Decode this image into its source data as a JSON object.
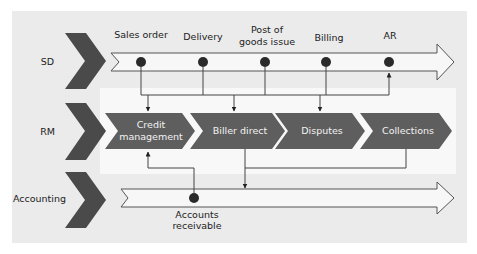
{
  "lanes": [
    {
      "id": "sd",
      "label": "SD"
    },
    {
      "id": "rm",
      "label": "RM"
    },
    {
      "id": "accounting",
      "label": "Accounting"
    }
  ],
  "sd_events": [
    {
      "lines": [
        "Sales order"
      ]
    },
    {
      "lines": [
        "Delivery"
      ]
    },
    {
      "lines": [
        "Post of",
        "goods issue"
      ]
    },
    {
      "lines": [
        "Billing"
      ]
    },
    {
      "lines": [
        "AR"
      ]
    }
  ],
  "rm_steps": [
    {
      "lines": [
        "Credit",
        "management"
      ]
    },
    {
      "lines": [
        "Biller direct"
      ]
    },
    {
      "lines": [
        "Disputes"
      ]
    },
    {
      "lines": [
        "Collections"
      ]
    }
  ],
  "accounting_events": [
    {
      "lines": [
        "Accounts",
        "receivable"
      ]
    }
  ],
  "colors": {
    "panel": "#ebebeb",
    "band": "#f8f8f8",
    "chevron": "#4a4a4a",
    "step": "#5e5e5e",
    "dot": "#2a2a2a",
    "line": "#444444"
  }
}
